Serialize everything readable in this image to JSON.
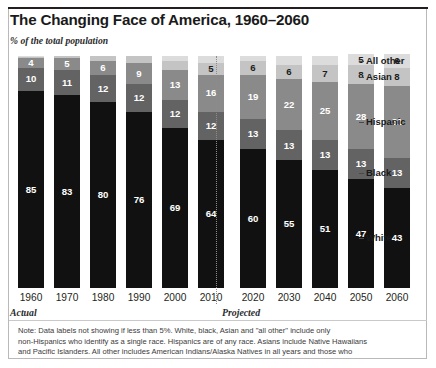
{
  "header": {
    "title": "The Changing Face of America, 1960–2060",
    "subtitle": "% of the total population"
  },
  "phases": {
    "actual_label": "Actual",
    "projected_label": "Projected"
  },
  "legend": [
    {
      "label": "All other",
      "color": "#dcdcdc"
    },
    {
      "label": "Asian",
      "color": "#c4c4c4"
    },
    {
      "label": "Hispanic",
      "color": "#8a8a8a"
    },
    {
      "label": "Black",
      "color": "#636363"
    },
    {
      "label": "White",
      "color": "#111111"
    }
  ],
  "note": {
    "line1": "Note: Data labels not showing if less than 5%. White, black, Asian and \"all other\" include only",
    "line2": "non-Hispanics who identify as a single race. Hispanics are of any race. Asians include Native Hawaiians",
    "line3": "and Pacific Islanders. All other includes American Indians/Alaska Natives in all years and those who"
  },
  "chart_data": {
    "type": "bar",
    "subtype": "stacked-column-100pct",
    "title": "The Changing Face of America, 1960–2060",
    "subtitle": "% of the total population",
    "xlabel": "",
    "ylabel": "% of the total population",
    "ylim": [
      0,
      100
    ],
    "grid": false,
    "legend_position": "right",
    "stack_order_bottom_to_top": [
      "White",
      "Black",
      "Hispanic",
      "Asian",
      "All other"
    ],
    "categories": [
      "1960",
      "1970",
      "1980",
      "1990",
      "2000",
      "2010",
      "2020",
      "2030",
      "2040",
      "2050",
      "2060"
    ],
    "actual_categories": [
      "1960",
      "1970",
      "1980",
      "1990",
      "2000",
      "2010"
    ],
    "projected_categories": [
      "2020",
      "2030",
      "2040",
      "2050",
      "2060"
    ],
    "series": [
      {
        "name": "White",
        "color": "#111111",
        "values": [
          85,
          83,
          80,
          76,
          69,
          64,
          60,
          55,
          51,
          47,
          43
        ]
      },
      {
        "name": "Black",
        "color": "#636363",
        "values": [
          10,
          11,
          12,
          12,
          12,
          12,
          13,
          13,
          13,
          13,
          13
        ]
      },
      {
        "name": "Hispanic",
        "color": "#8a8a8a",
        "values": [
          4,
          5,
          6,
          9,
          13,
          16,
          19,
          22,
          25,
          28,
          31
        ]
      },
      {
        "name": "Asian",
        "color": "#c4c4c4",
        "values": [
          0.5,
          1,
          2,
          3,
          4,
          5,
          6,
          6,
          7,
          8,
          8
        ]
      },
      {
        "name": "All other",
        "color": "#dcdcdc",
        "values": [
          0.5,
          0,
          0,
          0,
          2,
          3,
          2,
          4,
          4,
          5,
          6
        ]
      }
    ],
    "visible_labels": {
      "White": [
        "85",
        "83",
        "80",
        "76",
        "69",
        "64",
        "60",
        "55",
        "51",
        "47",
        "43"
      ],
      "Black": [
        "10",
        "11",
        "12",
        "12",
        "12",
        "12",
        "13",
        "13",
        "13",
        "13",
        "13"
      ],
      "Hispanic": [
        "4",
        "5",
        "6",
        "9",
        "13",
        "16",
        "19",
        "22",
        "25",
        "28",
        "31"
      ],
      "Asian": [
        "",
        "",
        "",
        "",
        "",
        "5",
        "6",
        "6",
        "7",
        "8",
        "8"
      ],
      "All other": [
        "",
        "",
        "",
        "",
        "",
        "",
        "",
        "",
        "",
        "5",
        "6"
      ]
    },
    "annotations": [
      "Actual",
      "Projected"
    ]
  }
}
